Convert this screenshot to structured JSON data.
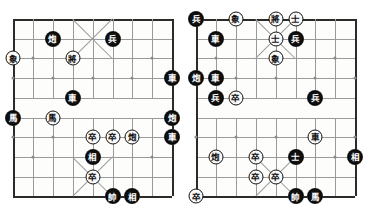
{
  "page": {
    "width": 369,
    "height": 214,
    "background": "#ffffff"
  },
  "palette": {
    "line": "#9a9a9a",
    "edge": "#2b2b2b",
    "black_piece_fill": "#101010",
    "black_piece_text": "#ffffff",
    "white_piece_fill": "#fafafa",
    "white_piece_text": "#101010",
    "star_point": "#8a8a8a"
  },
  "boards": [
    {
      "name": "left-board",
      "label": "Left Xiangqi Board",
      "origin_x": 13,
      "origin_y": 19,
      "cell_w": 19.9,
      "cell_h": 19.7,
      "cols": 9,
      "rows": 10,
      "pieces": [
        {
          "glyph": "炮",
          "side": "black",
          "col": 2,
          "row": 1,
          "name": "piece-cannon-black"
        },
        {
          "glyph": "兵",
          "side": "black",
          "col": 5,
          "row": 1,
          "name": "piece-soldier-black"
        },
        {
          "glyph": "象",
          "side": "white",
          "col": 0,
          "row": 2,
          "name": "piece-elephant-white"
        },
        {
          "glyph": "將",
          "side": "white",
          "col": 3,
          "row": 2,
          "name": "piece-general-white"
        },
        {
          "glyph": "車",
          "side": "black",
          "col": 8,
          "row": 3,
          "name": "piece-chariot-black"
        },
        {
          "glyph": "車",
          "side": "black",
          "col": 3,
          "row": 4,
          "name": "piece-chariot-black"
        },
        {
          "glyph": "馬",
          "side": "black",
          "col": 0,
          "row": 5,
          "name": "piece-horse-black"
        },
        {
          "glyph": "馬",
          "side": "white",
          "col": 2,
          "row": 5,
          "name": "piece-horse-white"
        },
        {
          "glyph": "炮",
          "side": "black",
          "col": 8,
          "row": 5,
          "name": "piece-cannon-black"
        },
        {
          "glyph": "卒",
          "side": "white",
          "col": 4,
          "row": 6,
          "name": "piece-pawn-white"
        },
        {
          "glyph": "卒",
          "side": "white",
          "col": 5,
          "row": 6,
          "name": "piece-pawn-white"
        },
        {
          "glyph": "炮",
          "side": "white",
          "col": 6,
          "row": 6,
          "name": "piece-cannon-white"
        },
        {
          "glyph": "車",
          "side": "black",
          "col": 8,
          "row": 6,
          "name": "piece-chariot-black"
        },
        {
          "glyph": "相",
          "side": "black",
          "col": 4,
          "row": 7,
          "name": "piece-minister-black"
        },
        {
          "glyph": "卒",
          "side": "white",
          "col": 4,
          "row": 8,
          "name": "piece-pawn-white"
        },
        {
          "glyph": "帥",
          "side": "black",
          "col": 5,
          "row": 9,
          "name": "piece-marshal-black"
        },
        {
          "glyph": "相",
          "side": "black",
          "col": 6,
          "row": 9,
          "name": "piece-minister-black"
        }
      ]
    },
    {
      "name": "right-board",
      "label": "Right Xiangqi Board",
      "origin_x": 196,
      "origin_y": 19,
      "cell_w": 19.9,
      "cell_h": 19.7,
      "cols": 9,
      "rows": 10,
      "pieces": [
        {
          "glyph": "兵",
          "side": "black",
          "col": 0,
          "row": 0,
          "name": "piece-soldier-black"
        },
        {
          "glyph": "象",
          "side": "white",
          "col": 2,
          "row": 0,
          "name": "piece-elephant-white"
        },
        {
          "glyph": "將",
          "side": "white",
          "col": 4,
          "row": 0,
          "name": "piece-general-white"
        },
        {
          "glyph": "士",
          "side": "white",
          "col": 5,
          "row": 0,
          "name": "piece-advisor-white"
        },
        {
          "glyph": "車",
          "side": "black",
          "col": 1,
          "row": 1,
          "name": "piece-chariot-black"
        },
        {
          "glyph": "士",
          "side": "white",
          "col": 4,
          "row": 1,
          "name": "piece-advisor-white"
        },
        {
          "glyph": "兵",
          "side": "black",
          "col": 5,
          "row": 1,
          "name": "piece-soldier-black"
        },
        {
          "glyph": "象",
          "side": "white",
          "col": 4,
          "row": 2,
          "name": "piece-elephant-white"
        },
        {
          "glyph": "炮",
          "side": "black",
          "col": 0,
          "row": 3,
          "name": "piece-cannon-black"
        },
        {
          "glyph": "車",
          "side": "black",
          "col": 1,
          "row": 3,
          "name": "piece-chariot-black"
        },
        {
          "glyph": "兵",
          "side": "black",
          "col": 1,
          "row": 4,
          "name": "piece-soldier-black"
        },
        {
          "glyph": "卒",
          "side": "white",
          "col": 2,
          "row": 4,
          "name": "piece-pawn-white"
        },
        {
          "glyph": "兵",
          "side": "black",
          "col": 6,
          "row": 4,
          "name": "piece-soldier-black"
        },
        {
          "glyph": "車",
          "side": "white",
          "col": 6,
          "row": 6,
          "name": "piece-chariot-white"
        },
        {
          "glyph": "炮",
          "side": "white",
          "col": 1,
          "row": 7,
          "name": "piece-cannon-white"
        },
        {
          "glyph": "卒",
          "side": "white",
          "col": 3,
          "row": 7,
          "name": "piece-pawn-white"
        },
        {
          "glyph": "士",
          "side": "black",
          "col": 5,
          "row": 7,
          "name": "piece-advisor-black"
        },
        {
          "glyph": "相",
          "side": "black",
          "col": 8,
          "row": 7,
          "name": "piece-minister-black"
        },
        {
          "glyph": "卒",
          "side": "white",
          "col": 3,
          "row": 8,
          "name": "piece-pawn-white"
        },
        {
          "glyph": "卒",
          "side": "white",
          "col": 4,
          "row": 8,
          "name": "piece-pawn-white"
        },
        {
          "glyph": "卒",
          "side": "white",
          "col": 0,
          "row": 9,
          "name": "piece-pawn-white"
        },
        {
          "glyph": "帥",
          "side": "black",
          "col": 5,
          "row": 9,
          "name": "piece-marshal-black"
        },
        {
          "glyph": "馬",
          "side": "black",
          "col": 6,
          "row": 9,
          "name": "piece-horse-black"
        }
      ]
    }
  ]
}
